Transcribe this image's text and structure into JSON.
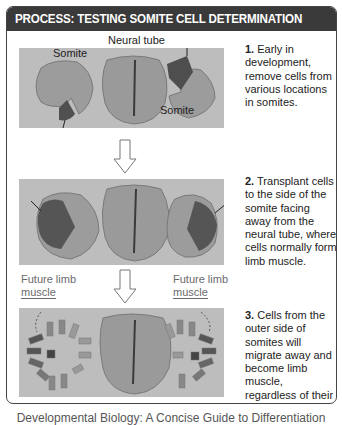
{
  "title": "PROCESS: TESTING SOMITE CELL DETERMINATION",
  "panels": [
    {
      "labels": {
        "neural_tube": "Neural tube",
        "somite_left": "Somite",
        "somite_right": "Somite"
      },
      "step_number": "1.",
      "step_text": "Early in development, remove cells from various locations in somites."
    },
    {
      "step_number": "2.",
      "step_text": "Transplant cells to the side of the somite facing away from the neural tube, where cells normally form limb muscle."
    },
    {
      "labels": {
        "future_left_line1": "Future limb",
        "future_left_line2": "muscle",
        "future_right_line1": "Future limb",
        "future_right_line2": "muscle"
      },
      "step_number": "3.",
      "step_text": "Cells from the outer side of somites will migrate away and become limb muscle, regardless of their original location."
    }
  ],
  "caption_partial": "Developmental Biology: A Concise Guide to Differentiation",
  "colors": {
    "title_bg": "#3a3a3a",
    "panel_bg": "#bdbdbd",
    "tissue_light": "#9a9a9a",
    "tissue_dark": "#4a4a4a",
    "border": "#444444"
  }
}
